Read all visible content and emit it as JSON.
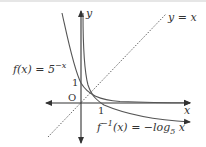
{
  "diagram": {
    "axes": {
      "x_label": "x",
      "y_label": "y",
      "origin_label": "O",
      "x_tick": "1",
      "y_tick": "1"
    },
    "curves": [
      {
        "name": "f",
        "label": "f(x) = 5^{-x}",
        "display": "f(x) = 5",
        "exponent": "−x"
      },
      {
        "name": "f-inverse",
        "label": "f^{-1}(x) = -log_5 x",
        "display_pre": "f",
        "sup": "−1",
        "display_post": "(x) = −log",
        "sub": "5",
        "tail": " x"
      }
    ],
    "reference_line": {
      "label": "y = x",
      "style": "dotted"
    },
    "colors": {
      "curve": "#555555",
      "axis": "#333333",
      "line": "#555555"
    }
  }
}
